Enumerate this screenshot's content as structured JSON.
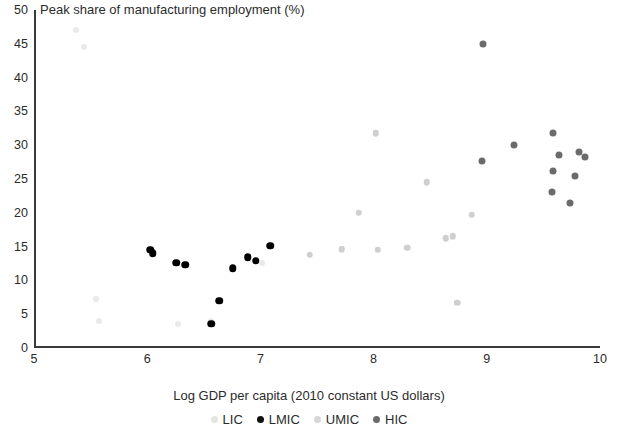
{
  "chart_data": {
    "type": "scatter",
    "title": "Peak share of manufacturing employment (%)",
    "xlabel": "Log GDP per capita (2010 constant US dollars)",
    "ylabel": "Peak share of manufacturing employment (%)",
    "xlim": [
      5,
      10
    ],
    "ylim": [
      0,
      50
    ],
    "xticks": [
      5,
      6,
      7,
      8,
      9,
      10
    ],
    "yticks": [
      0,
      5,
      10,
      15,
      20,
      25,
      30,
      35,
      40,
      45,
      50
    ],
    "grid": false,
    "legend_position": "bottom",
    "colors": {
      "LIC": "#e9e9e9",
      "LMIC": "#000000",
      "UMIC": "#cfcfcf",
      "HIC": "#6b6b6b"
    },
    "series": [
      {
        "name": "LIC",
        "label": "LIC",
        "color": "#e9e9e9",
        "points": [
          {
            "x": 5.35,
            "y": 47.0
          },
          {
            "x": 5.42,
            "y": 44.5
          },
          {
            "x": 5.53,
            "y": 7.2
          },
          {
            "x": 5.56,
            "y": 4.0
          },
          {
            "x": 6.25,
            "y": 3.5
          },
          {
            "x": 6.55,
            "y": 4.0
          },
          {
            "x": 7.0,
            "y": 12.6
          }
        ]
      },
      {
        "name": "LMIC",
        "label": "LMIC",
        "color": "#000000",
        "points": [
          {
            "x": 6.01,
            "y": 14.5
          },
          {
            "x": 6.03,
            "y": 14.0
          },
          {
            "x": 6.24,
            "y": 12.6
          },
          {
            "x": 6.32,
            "y": 12.3
          },
          {
            "x": 6.55,
            "y": 3.6
          },
          {
            "x": 6.62,
            "y": 7.0
          },
          {
            "x": 6.74,
            "y": 11.8
          },
          {
            "x": 6.87,
            "y": 13.4
          },
          {
            "x": 6.94,
            "y": 12.9
          },
          {
            "x": 7.07,
            "y": 15.1
          }
        ]
      },
      {
        "name": "UMIC",
        "label": "UMIC",
        "color": "#cfcfcf",
        "points": [
          {
            "x": 7.42,
            "y": 13.8
          },
          {
            "x": 7.7,
            "y": 14.6
          },
          {
            "x": 7.85,
            "y": 20.0
          },
          {
            "x": 8.0,
            "y": 31.8
          },
          {
            "x": 8.02,
            "y": 14.5
          },
          {
            "x": 8.28,
            "y": 14.8
          },
          {
            "x": 8.45,
            "y": 24.5
          },
          {
            "x": 8.62,
            "y": 16.2
          },
          {
            "x": 8.68,
            "y": 16.5
          },
          {
            "x": 8.72,
            "y": 6.7
          },
          {
            "x": 8.85,
            "y": 19.7
          }
        ]
      },
      {
        "name": "HIC",
        "label": "HIC",
        "color": "#6b6b6b",
        "points": [
          {
            "x": 8.95,
            "y": 45.0
          },
          {
            "x": 8.94,
            "y": 27.7
          },
          {
            "x": 9.22,
            "y": 30.0
          },
          {
            "x": 9.57,
            "y": 31.8
          },
          {
            "x": 9.62,
            "y": 28.5
          },
          {
            "x": 9.57,
            "y": 26.2
          },
          {
            "x": 9.8,
            "y": 29.0
          },
          {
            "x": 9.85,
            "y": 28.3
          },
          {
            "x": 9.56,
            "y": 23.1
          },
          {
            "x": 9.76,
            "y": 25.4
          },
          {
            "x": 9.72,
            "y": 21.5
          }
        ]
      }
    ]
  },
  "legend": {
    "items": [
      {
        "label": "LIC",
        "color": "#e4e4e4"
      },
      {
        "label": "LMIC",
        "color": "#111111"
      },
      {
        "label": "UMIC",
        "color": "#d6d6d6"
      },
      {
        "label": "HIC",
        "color": "#6b6b6b"
      }
    ]
  }
}
